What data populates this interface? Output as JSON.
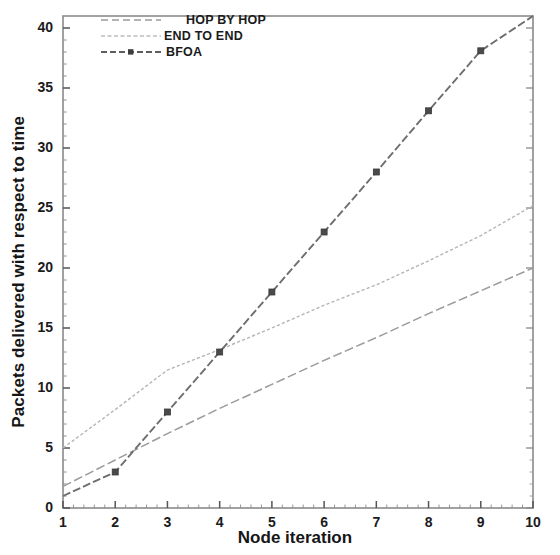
{
  "chart_data": {
    "type": "line",
    "title": "",
    "xlabel": "Node iteration",
    "ylabel": "Packets delivered with respect to time",
    "xlim": [
      1,
      10
    ],
    "ylim": [
      0,
      41
    ],
    "grid": false,
    "legend_position": "top-left",
    "x": [
      1,
      2,
      3,
      4,
      5,
      6,
      7,
      8,
      9,
      10
    ],
    "xticks": [
      "1",
      "2",
      "3",
      "4",
      "5",
      "6",
      "7",
      "8",
      "9",
      "10"
    ],
    "yticks": [
      "0",
      "5",
      "10",
      "15",
      "20",
      "25",
      "30",
      "35",
      "40"
    ],
    "series": [
      {
        "name": "HOP BY HOP",
        "style": "dashed",
        "color": "#9a9a9a",
        "marker": "none",
        "values": [
          1.8,
          4.0,
          6.2,
          8.3,
          10.3,
          12.3,
          14.2,
          16.2,
          18.1,
          20.0
        ]
      },
      {
        "name": "END TO END",
        "style": "fine-dashed",
        "color": "#b5b5b5",
        "marker": "none",
        "values": [
          5.0,
          8.2,
          11.5,
          13.2,
          15.0,
          16.9,
          18.6,
          20.6,
          22.7,
          25.2
        ]
      },
      {
        "name": "BFOA",
        "style": "dashed-marker",
        "color": "#6e6e6e",
        "marker": "square",
        "values": [
          1.0,
          3.0,
          8.0,
          13.0,
          18.0,
          23.0,
          28.0,
          33.1,
          38.1,
          41.0
        ]
      }
    ]
  },
  "legend": {
    "items": [
      {
        "label": "HOP BY HOP"
      },
      {
        "label": "END TO END"
      },
      {
        "label": "BFOA"
      }
    ]
  },
  "axes": {
    "x_title": "Node iteration",
    "y_title": "Packets delivered with respect to time"
  }
}
